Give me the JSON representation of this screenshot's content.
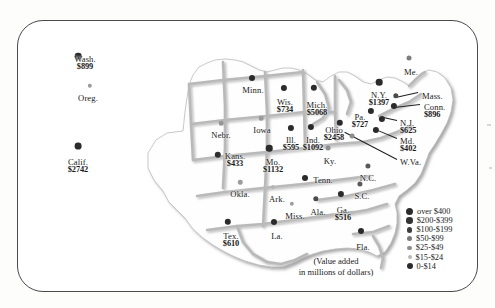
{
  "figure": {
    "caption_line1": "(Value added",
    "caption_line2": "in millions of dollars)",
    "units": "millions of dollars",
    "measure": "Value added"
  },
  "legend": {
    "title": "",
    "items": [
      {
        "label": "over $400",
        "size": 7.0,
        "color": "#2b2b2b"
      },
      {
        "label": "$200-$399",
        "size": 6.4,
        "color": "#333333"
      },
      {
        "label": "$100-$199",
        "size": 5.8,
        "color": "#3d3d3d"
      },
      {
        "label": "$50-$99",
        "size": 5.2,
        "color": "#7a7a7a"
      },
      {
        "label": "$25-$49",
        "size": 4.6,
        "color": "#8d8d8d"
      },
      {
        "label": "$15-$24",
        "size": 4.0,
        "color": "#b8b8b8"
      },
      {
        "label": "0-$14",
        "size": 6.0,
        "color": "#2b2b2b"
      }
    ]
  },
  "chart_data": {
    "type": "map",
    "title": "Value added in millions of dollars",
    "units": "millions of dollars",
    "legend_bins": [
      "over $400",
      "$200-$399",
      "$100-$199",
      "$50-$99",
      "$25-$49",
      "$15-$24",
      "0-$14"
    ],
    "states": [
      {
        "name": "Wash.",
        "value": 899,
        "value_label": "$899",
        "x": 85,
        "y": 55,
        "dot_x": 78,
        "dot_y": 56,
        "size": 6.6,
        "color": "#2b2b2b",
        "align": "center"
      },
      {
        "name": "Oreg.",
        "value": null,
        "value_label": "",
        "x": 88,
        "y": 94,
        "dot_x": 90,
        "dot_y": 86,
        "size": 4.4,
        "color": "#9a9a9a",
        "align": "center"
      },
      {
        "name": "Calif.",
        "value": 2742,
        "value_label": "$2742",
        "x": 78,
        "y": 158,
        "dot_x": 78,
        "dot_y": 146,
        "size": 6.8,
        "color": "#2b2b2b",
        "align": "center"
      },
      {
        "name": "Nebr.",
        "value": null,
        "value_label": "",
        "x": 221,
        "y": 131,
        "dot_x": 221,
        "dot_y": 123,
        "size": 4.5,
        "color": "#979797",
        "align": "center"
      },
      {
        "name": "Kans.",
        "value": 433,
        "value_label": "$433",
        "x": 235,
        "y": 152,
        "dot_x": 218,
        "dot_y": 155,
        "size": 6.4,
        "color": "#2f2f2f",
        "align": "center"
      },
      {
        "name": "Okla.",
        "value": null,
        "value_label": "",
        "x": 240,
        "y": 190,
        "dot_x": 240,
        "dot_y": 182,
        "size": 4.5,
        "color": "#9c9c9c",
        "align": "center"
      },
      {
        "name": "Tex.",
        "value": 610,
        "value_label": "$610",
        "x": 231,
        "y": 232,
        "dot_x": 228,
        "dot_y": 222,
        "size": 6.4,
        "color": "#2b2b2b",
        "align": "center"
      },
      {
        "name": "Minn.",
        "value": null,
        "value_label": "",
        "x": 253,
        "y": 86,
        "dot_x": 252,
        "dot_y": 78,
        "size": 6.0,
        "color": "#2b2b2b",
        "align": "center"
      },
      {
        "name": "Iowa",
        "value": null,
        "value_label": "",
        "x": 262,
        "y": 126,
        "dot_x": 261,
        "dot_y": 118,
        "size": 4.6,
        "color": "#9a9a9a",
        "align": "center"
      },
      {
        "name": "Mo.",
        "value": 1132,
        "value_label": "$1132",
        "x": 273,
        "y": 158,
        "dot_x": 269,
        "dot_y": 148,
        "size": 6.5,
        "color": "#2b2b2b",
        "align": "center"
      },
      {
        "name": "Ark.",
        "value": null,
        "value_label": "",
        "x": 277,
        "y": 195,
        "dot_x": 273,
        "dot_y": 187,
        "size": 4.2,
        "color": "#b4b4b4",
        "align": "center"
      },
      {
        "name": "La.",
        "value": null,
        "value_label": "",
        "x": 277,
        "y": 232,
        "dot_x": 274,
        "dot_y": 222,
        "size": 6.0,
        "color": "#2b2b2b",
        "align": "center"
      },
      {
        "name": "Miss.",
        "value": null,
        "value_label": "",
        "x": 295,
        "y": 212,
        "dot_x": 292,
        "dot_y": 204,
        "size": 4.4,
        "color": "#9e9e9e",
        "align": "center"
      },
      {
        "name": "Wis.",
        "value": 734,
        "value_label": "$734",
        "x": 285,
        "y": 98,
        "dot_x": 284,
        "dot_y": 88,
        "size": 6.2,
        "color": "#2b2b2b",
        "align": "center"
      },
      {
        "name": "Ill.",
        "value": 595,
        "value_label": "$595",
        "x": 291,
        "y": 136,
        "dot_x": 291,
        "dot_y": 128,
        "size": 6.2,
        "color": "#2b2b2b",
        "align": "center"
      },
      {
        "name": "Ind.",
        "value": 1092,
        "value_label": "$1092",
        "x": 313,
        "y": 136,
        "dot_x": 311,
        "dot_y": 127,
        "size": 6.2,
        "color": "#2b2b2b",
        "align": "center"
      },
      {
        "name": "Mich.",
        "value": 5068,
        "value_label": "$5068",
        "x": 317,
        "y": 101,
        "dot_x": 314,
        "dot_y": 88,
        "size": 6.3,
        "color": "#2b2b2b",
        "align": "center"
      },
      {
        "name": "Ohio",
        "value": 2458,
        "value_label": "$2458",
        "x": 334,
        "y": 126,
        "dot_x": 340,
        "dot_y": 123,
        "size": 6.4,
        "color": "#2b2b2b",
        "align": "center"
      },
      {
        "name": "Ky.",
        "value": null,
        "value_label": "",
        "x": 330,
        "y": 157,
        "dot_x": 328,
        "dot_y": 148,
        "size": 4.8,
        "color": "#8e8e8e",
        "align": "center"
      },
      {
        "name": "Tenn.",
        "value": null,
        "value_label": "",
        "x": 323,
        "y": 176,
        "dot_x": 305,
        "dot_y": 178,
        "size": 6.0,
        "color": "#2b2b2b",
        "align": "center"
      },
      {
        "name": "Ala.",
        "value": null,
        "value_label": "",
        "x": 318,
        "y": 208,
        "dot_x": 316,
        "dot_y": 199,
        "size": 5.4,
        "color": "#4a4a4a",
        "align": "center"
      },
      {
        "name": "Ga.",
        "value": 516,
        "value_label": "$516",
        "x": 343,
        "y": 206,
        "dot_x": 341,
        "dot_y": 194,
        "size": 6.2,
        "color": "#2b2b2b",
        "align": "center"
      },
      {
        "name": "Fla.",
        "value": null,
        "value_label": "",
        "x": 363,
        "y": 243,
        "dot_x": 361,
        "dot_y": 231,
        "size": 6.0,
        "color": "#2b2b2b",
        "align": "center"
      },
      {
        "name": "S.C.",
        "value": null,
        "value_label": "",
        "x": 362,
        "y": 192,
        "dot_x": 360,
        "dot_y": 184,
        "size": 5.2,
        "color": "#5a5a5a",
        "align": "center"
      },
      {
        "name": "N.C.",
        "value": null,
        "value_label": "",
        "x": 368,
        "y": 174,
        "dot_x": 368,
        "dot_y": 166,
        "size": 5.2,
        "color": "#5a5a5a",
        "align": "center"
      },
      {
        "name": "Pa.",
        "value": 727,
        "value_label": "$727",
        "x": 360,
        "y": 113,
        "dot_x": 371,
        "dot_y": 111,
        "size": 6.2,
        "color": "#2b2b2b",
        "align": "center"
      },
      {
        "name": "N.Y.",
        "value": 1397,
        "value_label": "$1397",
        "x": 379,
        "y": 91,
        "dot_x": 379,
        "dot_y": 82,
        "size": 6.6,
        "color": "#2b2b2b",
        "align": "center"
      },
      {
        "name": "Me.",
        "value": null,
        "value_label": "",
        "x": 411,
        "y": 68,
        "dot_x": 409,
        "dot_y": 58,
        "size": 5.0,
        "color": "#7d7d7d",
        "align": "center"
      },
      {
        "name": "Mass.",
        "value": null,
        "value_label": "",
        "x": 422,
        "y": 92,
        "dot_x": 396,
        "dot_y": 96,
        "size": 5.4,
        "color": "#4a4a4a",
        "align": "left"
      },
      {
        "name": "Conn.",
        "value": 896,
        "value_label": "$896",
        "x": 424,
        "y": 103,
        "dot_x": 394,
        "dot_y": 106,
        "size": 6.2,
        "color": "#2b2b2b",
        "align": "left"
      },
      {
        "name": "N.J.",
        "value": 625,
        "value_label": "$625",
        "x": 400,
        "y": 119,
        "dot_x": 382,
        "dot_y": 119,
        "size": 6.2,
        "color": "#2b2b2b",
        "align": "left"
      },
      {
        "name": "Md.",
        "value": 402,
        "value_label": "$402",
        "x": 400,
        "y": 137,
        "dot_x": 376,
        "dot_y": 130,
        "size": 6.2,
        "color": "#2b2b2b",
        "align": "left"
      },
      {
        "name": "W.Va.",
        "value": null,
        "value_label": "",
        "x": 400,
        "y": 158,
        "dot_x": 352,
        "dot_y": 136,
        "size": 4.8,
        "color": "#8e8e8e",
        "align": "left"
      }
    ],
    "leaders": [
      {
        "x1": 418,
        "y1": 92,
        "x2": 396,
        "y2": 97
      },
      {
        "x1": 420,
        "y1": 104,
        "x2": 394,
        "y2": 107
      },
      {
        "x1": 397,
        "y1": 120,
        "x2": 383,
        "y2": 117
      },
      {
        "x1": 397,
        "y1": 138,
        "x2": 378,
        "y2": 130
      },
      {
        "x1": 397,
        "y1": 159,
        "x2": 345,
        "y2": 132
      }
    ]
  }
}
